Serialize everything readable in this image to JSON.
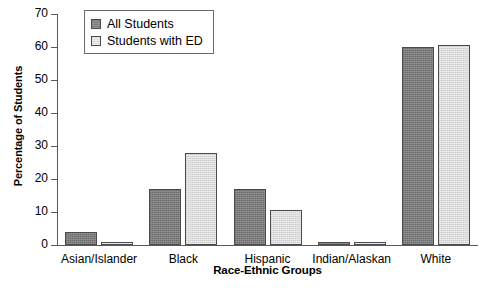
{
  "chart_data": {
    "type": "bar",
    "title": "",
    "xlabel": "Race-Ethnic Groups",
    "ylabel": "Percentage of Students",
    "categories": [
      "Asian/Islander",
      "Black",
      "Hispanic",
      "Indian/Alaskan",
      "White"
    ],
    "series": [
      {
        "name": "All Students",
        "values": [
          4,
          17,
          17,
          1,
          60
        ],
        "color": "#7c7c7c"
      },
      {
        "name": "Students with ED",
        "values": [
          1,
          28,
          10.5,
          1,
          60.5
        ],
        "color": "#dcdcdc"
      }
    ],
    "ylim": [
      0,
      70
    ],
    "yticks": [
      0,
      10,
      20,
      30,
      40,
      50,
      60,
      70
    ],
    "ytick_labels": [
      "0",
      "10",
      "20",
      "30",
      "40",
      "50",
      "60",
      "70"
    ],
    "grid": false,
    "legend_position": "upper left"
  }
}
